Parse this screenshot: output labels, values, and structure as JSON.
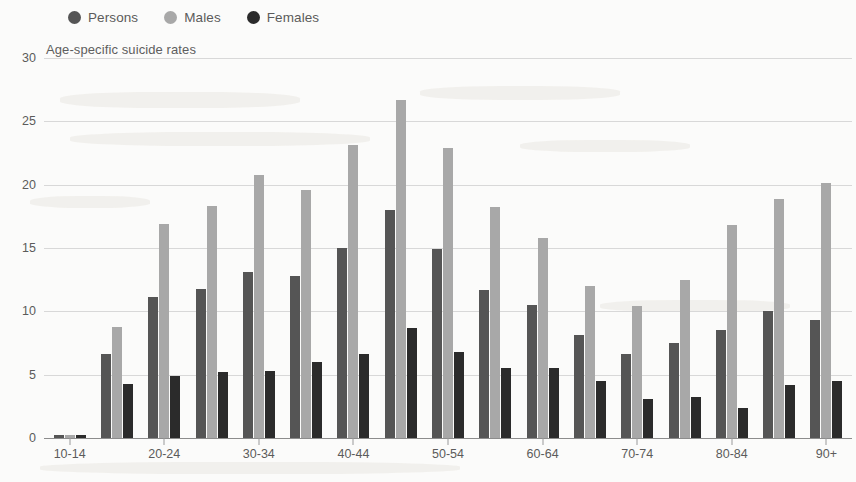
{
  "legend": {
    "position": "top-left",
    "items": [
      {
        "label": "Persons",
        "color": "#555555",
        "icon": "circle-marker-icon"
      },
      {
        "label": "Males",
        "color": "#a8a8a8",
        "icon": "circle-marker-icon"
      },
      {
        "label": "Females",
        "color": "#2b2b2b",
        "icon": "circle-marker-icon"
      }
    ]
  },
  "chart_data": {
    "type": "bar",
    "title": "Age-specific suicide rates",
    "xlabel": "",
    "ylabel": "",
    "ylim": [
      0,
      30
    ],
    "yticks": [
      0,
      5,
      10,
      15,
      20,
      25,
      30
    ],
    "grid": true,
    "legend_position": "top-left",
    "categories": [
      "10-14",
      "15-19",
      "20-24",
      "25-29",
      "30-34",
      "35-39",
      "40-44",
      "45-49",
      "50-54",
      "55-59",
      "60-64",
      "65-69",
      "70-74",
      "75-79",
      "80-84",
      "85-89",
      "90+"
    ],
    "tick_labels_shown": [
      "10-14",
      "",
      "20-24",
      "",
      "30-34",
      "",
      "40-44",
      "",
      "50-54",
      "",
      "60-64",
      "",
      "70-74",
      "",
      "80-84",
      "",
      "90+"
    ],
    "series": [
      {
        "name": "Persons",
        "color": "#555555",
        "values": [
          0.2,
          6.6,
          11.1,
          11.8,
          13.1,
          12.8,
          15.0,
          18.0,
          14.9,
          11.7,
          10.5,
          8.1,
          6.6,
          7.5,
          8.5,
          10.0,
          9.3
        ]
      },
      {
        "name": "Males",
        "color": "#a8a8a8",
        "values": [
          0.2,
          8.8,
          16.9,
          18.3,
          20.8,
          19.6,
          23.1,
          26.7,
          22.9,
          18.2,
          15.8,
          12.0,
          10.4,
          12.5,
          16.8,
          18.9,
          20.1
        ]
      },
      {
        "name": "Females",
        "color": "#2b2b2b",
        "values": [
          0.2,
          4.3,
          4.9,
          5.2,
          5.3,
          6.0,
          6.6,
          8.7,
          6.8,
          5.5,
          5.5,
          4.5,
          3.1,
          3.2,
          2.4,
          4.2,
          4.5
        ]
      }
    ]
  }
}
